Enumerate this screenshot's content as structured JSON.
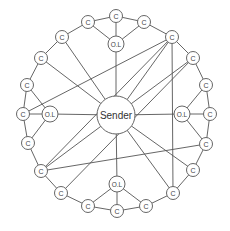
{
  "diagram": {
    "labels": {
      "sender": "Sender",
      "client": "C",
      "ol": "O.L"
    },
    "sender": {
      "id": "S",
      "label": "Sender",
      "x": 116,
      "y": 115,
      "r": 19
    },
    "nodes": [
      {
        "id": "c1",
        "label": "C",
        "x": 88,
        "y": 22,
        "type": "c"
      },
      {
        "id": "c2",
        "label": "C",
        "x": 116,
        "y": 16,
        "type": "c"
      },
      {
        "id": "c3",
        "label": "C",
        "x": 144,
        "y": 22,
        "type": "c"
      },
      {
        "id": "c4",
        "label": "C",
        "x": 172,
        "y": 37,
        "type": "c"
      },
      {
        "id": "c5",
        "label": "C",
        "x": 193,
        "y": 58,
        "type": "c"
      },
      {
        "id": "c6",
        "label": "C",
        "x": 206,
        "y": 85,
        "type": "c"
      },
      {
        "id": "c7",
        "label": "C",
        "x": 210,
        "y": 114,
        "type": "c"
      },
      {
        "id": "c8",
        "label": "C",
        "x": 206,
        "y": 144,
        "type": "c"
      },
      {
        "id": "c9",
        "label": "C",
        "x": 193,
        "y": 170,
        "type": "c"
      },
      {
        "id": "c10",
        "label": "C",
        "x": 173,
        "y": 193,
        "type": "c"
      },
      {
        "id": "c11",
        "label": "C",
        "x": 146,
        "y": 206,
        "type": "c"
      },
      {
        "id": "c12",
        "label": "C",
        "x": 117,
        "y": 211,
        "type": "c"
      },
      {
        "id": "c13",
        "label": "C",
        "x": 88,
        "y": 206,
        "type": "c"
      },
      {
        "id": "c14",
        "label": "C",
        "x": 61,
        "y": 193,
        "type": "c"
      },
      {
        "id": "c15",
        "label": "C",
        "x": 41,
        "y": 171,
        "type": "c"
      },
      {
        "id": "c16",
        "label": "C",
        "x": 28,
        "y": 143,
        "type": "c"
      },
      {
        "id": "c17",
        "label": "C",
        "x": 23,
        "y": 114,
        "type": "c"
      },
      {
        "id": "c18",
        "label": "C",
        "x": 27,
        "y": 85,
        "type": "c"
      },
      {
        "id": "c19",
        "label": "C",
        "x": 41,
        "y": 58,
        "type": "c"
      },
      {
        "id": "c20",
        "label": "C",
        "x": 62,
        "y": 37,
        "type": "c"
      },
      {
        "id": "olT",
        "label": "O.L",
        "x": 116,
        "y": 44,
        "type": "ol"
      },
      {
        "id": "olR",
        "label": "O.L",
        "x": 182,
        "y": 114,
        "type": "ol"
      },
      {
        "id": "olB",
        "label": "O.L",
        "x": 117,
        "y": 184,
        "type": "ol"
      },
      {
        "id": "olL",
        "label": "O.L",
        "x": 50,
        "y": 114,
        "type": "ol"
      }
    ],
    "edges": [
      [
        "c1",
        "c2"
      ],
      [
        "c2",
        "c3"
      ],
      [
        "c3",
        "c4"
      ],
      [
        "c4",
        "c5"
      ],
      [
        "c5",
        "c6"
      ],
      [
        "c6",
        "c7"
      ],
      [
        "c7",
        "c8"
      ],
      [
        "c8",
        "c9"
      ],
      [
        "c9",
        "c10"
      ],
      [
        "c10",
        "c11"
      ],
      [
        "c11",
        "c12"
      ],
      [
        "c12",
        "c13"
      ],
      [
        "c13",
        "c14"
      ],
      [
        "c14",
        "c15"
      ],
      [
        "c15",
        "c16"
      ],
      [
        "c16",
        "c17"
      ],
      [
        "c17",
        "c18"
      ],
      [
        "c18",
        "c19"
      ],
      [
        "c19",
        "c20"
      ],
      [
        "c20",
        "c1"
      ],
      [
        "olT",
        "c1"
      ],
      [
        "olT",
        "c2"
      ],
      [
        "olT",
        "c3"
      ],
      [
        "olT",
        "S"
      ],
      [
        "olR",
        "c6"
      ],
      [
        "olR",
        "c7"
      ],
      [
        "olR",
        "c8"
      ],
      [
        "olR",
        "S"
      ],
      [
        "olB",
        "c13"
      ],
      [
        "olB",
        "c12"
      ],
      [
        "olB",
        "c11"
      ],
      [
        "olB",
        "S"
      ],
      [
        "olL",
        "c18"
      ],
      [
        "olL",
        "c17"
      ],
      [
        "olL",
        "c16"
      ],
      [
        "olL",
        "S"
      ],
      [
        "c20",
        "S"
      ],
      [
        "c19",
        "S"
      ],
      [
        "c4",
        "S"
      ],
      [
        "c4",
        "c10"
      ],
      [
        "c4",
        "c15"
      ],
      [
        "c4",
        "c17"
      ],
      [
        "c5",
        "S"
      ],
      [
        "c5",
        "c14"
      ],
      [
        "c15",
        "S"
      ],
      [
        "c15",
        "c8"
      ],
      [
        "S",
        "c9"
      ],
      [
        "S",
        "c10"
      ]
    ]
  }
}
